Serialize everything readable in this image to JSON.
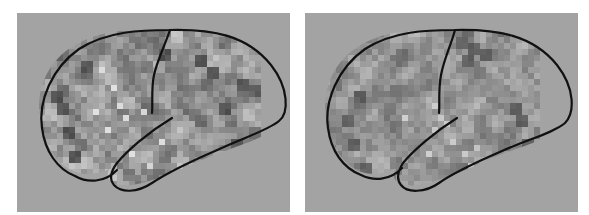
{
  "figure": {
    "background": "#ffffff",
    "panel_background": "#a3a3a3",
    "outline_color": "#111111",
    "panels": [
      {
        "id": "left",
        "label": "",
        "grid": {
          "x0": 22,
          "y0": 18,
          "cell": 6,
          "cols": 37,
          "rows": 29,
          "seed": 7,
          "mean": 150,
          "spread": 46,
          "bright_spots": [
            [
              10,
              6
            ],
            [
              12,
              9
            ],
            [
              13,
              12
            ],
            [
              14,
              14
            ],
            [
              9,
              13
            ],
            [
              11,
              16
            ],
            [
              15,
              20
            ],
            [
              18,
              22
            ],
            [
              20,
              18
            ],
            [
              17,
              13
            ],
            [
              21,
              24
            ],
            [
              16,
              26
            ],
            [
              19,
              25
            ]
          ],
          "dark_spots": [
            [
              3,
              12
            ],
            [
              4,
              16
            ],
            [
              5,
              20
            ],
            [
              2,
              10
            ],
            [
              30,
              12
            ],
            [
              32,
              18
            ],
            [
              31,
              22
            ],
            [
              28,
              6
            ],
            [
              26,
              4
            ],
            [
              7,
              5
            ],
            [
              20,
              3
            ],
            [
              33,
              8
            ]
          ]
        }
      },
      {
        "id": "right",
        "label": "",
        "grid": {
          "x0": 19,
          "y0": 18,
          "cell": 6,
          "cols": 36,
          "rows": 29,
          "seed": 19,
          "mean": 148,
          "spread": 36,
          "bright_spots": [
            [
              18,
              12
            ],
            [
              19,
              14
            ],
            [
              20,
              15
            ],
            [
              18,
              16
            ],
            [
              21,
              18
            ],
            [
              23,
              20
            ],
            [
              24,
              22
            ],
            [
              22,
              24
            ],
            [
              17,
              20
            ],
            [
              25,
              19
            ],
            [
              26,
              24
            ],
            [
              13,
              14
            ]
          ],
          "dark_spots": [
            [
              22,
              1
            ],
            [
              24,
              2
            ],
            [
              23,
              4
            ],
            [
              26,
              3
            ],
            [
              32,
              14
            ],
            [
              31,
              12
            ],
            [
              33,
              18
            ],
            [
              32,
              22
            ],
            [
              3,
              14
            ],
            [
              4,
              18
            ],
            [
              6,
              22
            ],
            [
              5,
              10
            ]
          ]
        }
      }
    ]
  }
}
